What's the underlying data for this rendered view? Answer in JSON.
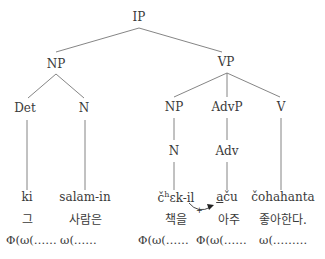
{
  "tree": {
    "root": "IP",
    "np_subject": "NP",
    "vp": "VP",
    "det": "Det",
    "n_subject": "N",
    "np_object": "NP",
    "advp": "AdvP",
    "v": "V",
    "n_object": "N",
    "adv": "Adv"
  },
  "words": {
    "romanized": [
      {
        "text": "ki"
      },
      {
        "text": "salam-in"
      },
      {
        "pre": "č",
        "sup": "h",
        "post": "ɛk-il"
      },
      {
        "ul": "a",
        "post": "ču"
      },
      {
        "text": "čohahanta"
      }
    ],
    "korean": [
      "그",
      "사람은",
      "책을",
      "아주",
      "좋아한다."
    ],
    "prosody": [
      "Φ(ω(……",
      "ω(……",
      "Φ(ω(……",
      "Φ(ω(……",
      "ω(………"
    ]
  },
  "annotation": {
    "arrow_label": "+",
    "arrow": "curved-arrow-right"
  }
}
